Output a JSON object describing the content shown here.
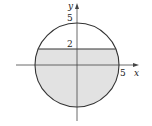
{
  "diagram": {
    "axes": {
      "x_label": "x",
      "y_label": "y"
    },
    "tick_labels": {
      "y_top": "5",
      "y_line": "2",
      "x_right": "5"
    },
    "circle": {
      "radius": 5,
      "center": [
        0,
        0
      ]
    },
    "horizontal_line": {
      "y": 2
    },
    "shaded_region": "disk x^2 + y^2 <= 25 with y <= 2",
    "colors": {
      "stroke": "#333333",
      "shade": "#e2e2e2",
      "axis": "#444444"
    }
  }
}
